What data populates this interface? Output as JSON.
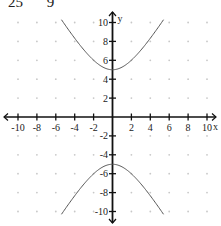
{
  "header": {
    "fragment_left": "25",
    "fragment_right": "9"
  },
  "chart_data": {
    "type": "line",
    "title": "",
    "equation": "y^2/25 - x^2/9 = 1",
    "xlabel": "x",
    "ylabel": "y",
    "xlim": [
      -10.5,
      10.5
    ],
    "ylim": [
      -11,
      11
    ],
    "x_ticks": [
      -10,
      -8,
      -6,
      -4,
      -2,
      2,
      4,
      6,
      8,
      10
    ],
    "y_ticks": [
      10,
      8,
      6,
      4,
      2,
      -2,
      -4,
      -6,
      -8,
      -10
    ],
    "x_tick_labels": [
      "-10",
      "-8",
      "-6",
      "-4",
      "-2",
      "2",
      "4",
      "6",
      "8",
      "10"
    ],
    "y_tick_labels": [
      "10",
      "8",
      "6",
      "4",
      "2",
      "-2",
      "-4",
      "-6",
      "-8",
      "-10"
    ],
    "grid": "dots every 2 units",
    "series": [
      {
        "name": "upper branch",
        "x": [
          -5.4,
          -4,
          -3,
          -2,
          -1,
          0,
          1,
          2,
          3,
          4,
          5.4
        ],
        "y": [
          10.3,
          8.33,
          7.07,
          6.01,
          5.27,
          5,
          5.27,
          6.01,
          7.07,
          8.33,
          10.3
        ]
      },
      {
        "name": "lower branch",
        "x": [
          -5.4,
          -4,
          -3,
          -2,
          -1,
          0,
          1,
          2,
          3,
          4,
          5.4
        ],
        "y": [
          -10.3,
          -8.33,
          -7.07,
          -6.01,
          -5.27,
          -5,
          -5.27,
          -6.01,
          -7.07,
          -8.33,
          -10.3
        ]
      }
    ],
    "colors": {
      "curve": "#555555",
      "axes": "#111111",
      "grid_dots": "#c8c8c8"
    }
  }
}
